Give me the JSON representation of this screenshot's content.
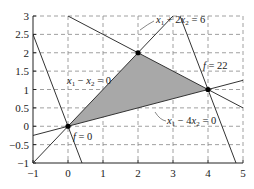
{
  "chart_data": {
    "type": "line",
    "title": "",
    "xlabel": "",
    "ylabel": "",
    "xlim": [
      -1,
      5
    ],
    "ylim": [
      -1,
      3
    ],
    "grid": true,
    "grid_style": "dashed",
    "xticks": [
      -1,
      0,
      1,
      2,
      3,
      4,
      5
    ],
    "xtick_labels": [
      "−1",
      "0",
      "1",
      "2",
      "3",
      "4",
      "5"
    ],
    "yticks": [
      -1,
      -0.5,
      0,
      0.5,
      1,
      1.5,
      2,
      2.5,
      3
    ],
    "ytick_labels": [
      "−1",
      "−0.5",
      "0",
      "0.5",
      "1",
      "1.5",
      "2",
      "2.5",
      "3"
    ],
    "feasible_region": {
      "fill": "#a8a8a8",
      "vertices": [
        [
          0,
          0
        ],
        [
          2,
          2
        ],
        [
          4,
          1
        ]
      ]
    },
    "lines": [
      {
        "name": "x1 + 2x2 = 6",
        "points": [
          [
            0,
            3
          ],
          [
            5,
            0.5
          ]
        ]
      },
      {
        "name": "x1 - x2 = 0",
        "points": [
          [
            -1,
            -1
          ],
          [
            3,
            3
          ]
        ]
      },
      {
        "name": "x1 - 4x2 = 0",
        "points": [
          [
            -1,
            -0.25
          ],
          [
            5,
            1.25
          ]
        ]
      },
      {
        "name": "f = 0",
        "points": [
          [
            -1,
            2.5
          ],
          [
            0.4,
            -1
          ]
        ]
      },
      {
        "name": "f = 22",
        "points": [
          [
            3.2,
            3
          ],
          [
            4.8,
            -1
          ]
        ]
      }
    ],
    "points": [
      {
        "x": 0,
        "y": 0,
        "label": "f = 0"
      },
      {
        "x": 2,
        "y": 2,
        "label": ""
      },
      {
        "x": 4,
        "y": 1,
        "label": "f = 22"
      }
    ],
    "annotations": [
      {
        "text": "x1 + 2x2 = 6",
        "x": 2.5,
        "y": 2.8
      },
      {
        "text": "x1 − x2 = 0",
        "x": 0.2,
        "y": 1.05
      },
      {
        "text": "x1 − 4x2 = 0",
        "x": 2.6,
        "y": 0.55
      },
      {
        "text": "f = 22",
        "x": 3.55,
        "y": 1.35
      },
      {
        "text": "f = 0",
        "x": 0.15,
        "y": -0.15
      }
    ]
  },
  "labels": {
    "eq1_a": "x",
    "eq1_sub1": "1",
    "eq1_b": " + 2",
    "eq1_c": "x",
    "eq1_sub2": "2",
    "eq1_d": " = 6",
    "eq2_a": "x",
    "eq2_sub1": "1",
    "eq2_b": " − ",
    "eq2_c": "x",
    "eq2_sub2": "2",
    "eq2_d": " = 0",
    "eq3_a": "x",
    "eq3_sub1": "1",
    "eq3_b": " − 4",
    "eq3_c": "x",
    "eq3_sub2": "2",
    "eq3_d": " = 0",
    "f22_a": "f",
    "f22_b": " = 22",
    "f0_a": "f",
    "f0_b": " = 0"
  }
}
